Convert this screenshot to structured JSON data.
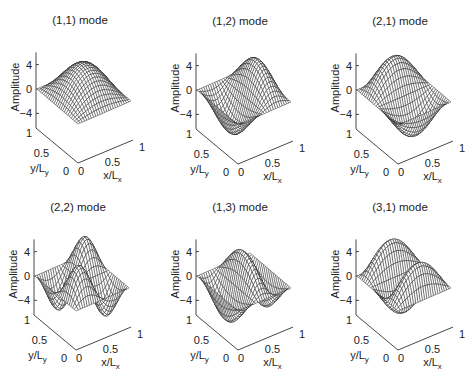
{
  "figure": {
    "width": 470,
    "height": 373,
    "background": "#ffffff",
    "mesh_color": "#1a1a1a",
    "face_color": "#ffffff",
    "axis_color": "#333333"
  },
  "chart_data": [
    {
      "type": "surface",
      "title": "(1,1) mode",
      "mode": [
        1,
        1
      ],
      "function": "A*sin(1*pi*x)*sin(1*pi*y)",
      "amplitude": 5,
      "sign": 1,
      "kx": 1,
      "ky": 1,
      "xlabel": "x/L_x",
      "ylabel": "y/L_y",
      "zlabel": "Amplitude",
      "xlim": [
        0,
        1
      ],
      "ylim": [
        0,
        1
      ],
      "zlim": [
        -6,
        6
      ],
      "xticks": [
        0,
        0.5,
        1
      ],
      "yticks": [
        0,
        0.5,
        1
      ],
      "zticks": [
        -4,
        0,
        4
      ],
      "grid": false
    },
    {
      "type": "surface",
      "title": "(1,2) mode",
      "mode": [
        1,
        2
      ],
      "function": "A*sin(2*pi*x)*sin(1*pi*y)",
      "amplitude": 5,
      "sign": -1,
      "kx": 2,
      "ky": 1,
      "xlabel": "x/L_x",
      "ylabel": "y/L_y",
      "zlabel": "Amplitude",
      "xlim": [
        0,
        1
      ],
      "ylim": [
        0,
        1
      ],
      "zlim": [
        -6,
        6
      ],
      "xticks": [
        0,
        0.5,
        1
      ],
      "yticks": [
        0,
        0.5,
        1
      ],
      "zticks": [
        -4,
        0,
        4
      ],
      "grid": false
    },
    {
      "type": "surface",
      "title": "(2,1) mode",
      "mode": [
        2,
        1
      ],
      "function": "A*sin(1*pi*x)*sin(2*pi*y)",
      "amplitude": 5,
      "sign": -1,
      "kx": 1,
      "ky": 2,
      "xlabel": "x/L_x",
      "ylabel": "y/L_y",
      "zlabel": "Amplitude",
      "xlim": [
        0,
        1
      ],
      "ylim": [
        0,
        1
      ],
      "zlim": [
        -6,
        6
      ],
      "xticks": [
        0,
        0.5,
        1
      ],
      "yticks": [
        0,
        0.5,
        1
      ],
      "zticks": [
        -4,
        0,
        4
      ],
      "grid": false
    },
    {
      "type": "surface",
      "title": "(2,2) mode",
      "mode": [
        2,
        2
      ],
      "function": "A*sin(2*pi*x)*sin(2*pi*y)",
      "amplitude": 5,
      "sign": 1,
      "kx": 2,
      "ky": 2,
      "xlabel": "x/L_x",
      "ylabel": "y/L_y",
      "zlabel": "Amplitude",
      "xlim": [
        0,
        1
      ],
      "ylim": [
        0,
        1
      ],
      "zlim": [
        -6,
        6
      ],
      "xticks": [
        0,
        0.5,
        1
      ],
      "yticks": [
        0,
        0.5,
        1
      ],
      "zticks": [
        -4,
        0,
        4
      ],
      "grid": false
    },
    {
      "type": "surface",
      "title": "(1,3) mode",
      "mode": [
        1,
        3
      ],
      "function": "A*sin(3*pi*x)*sin(1*pi*y)",
      "amplitude": 5,
      "sign": -1,
      "kx": 3,
      "ky": 1,
      "xlabel": "x/L_x",
      "ylabel": "y/L_y",
      "zlabel": "Amplitude",
      "xlim": [
        0,
        1
      ],
      "ylim": [
        0,
        1
      ],
      "zlim": [
        -6,
        6
      ],
      "xticks": [
        0,
        0.5,
        1
      ],
      "yticks": [
        0,
        0.5,
        1
      ],
      "zticks": [
        -4,
        0,
        4
      ],
      "grid": false
    },
    {
      "type": "surface",
      "title": "(3,1) mode",
      "mode": [
        3,
        1
      ],
      "function": "A*sin(1*pi*x)*sin(3*pi*y)",
      "amplitude": 5,
      "sign": 1,
      "kx": 1,
      "ky": 3,
      "xlabel": "x/L_x",
      "ylabel": "y/L_y",
      "zlabel": "Amplitude",
      "xlim": [
        0,
        1
      ],
      "ylim": [
        0,
        1
      ],
      "zlim": [
        -6,
        6
      ],
      "xticks": [
        0,
        0.5,
        1
      ],
      "yticks": [
        0,
        0.5,
        1
      ],
      "zticks": [
        -4,
        0,
        4
      ],
      "grid": false
    }
  ],
  "labels": {
    "zlabel": "Amplitude",
    "x_main": "x/L",
    "x_sub": "x",
    "y_main": "y/L",
    "y_sub": "y",
    "ztick_top": "4",
    "ztick_mid": "0",
    "ztick_bot": "−4",
    "ytick_1": "1",
    "ytick_05": "0.5",
    "ytick_0": "0",
    "xtick_0": "0",
    "xtick_05": "0.5",
    "xtick_1": "1"
  }
}
